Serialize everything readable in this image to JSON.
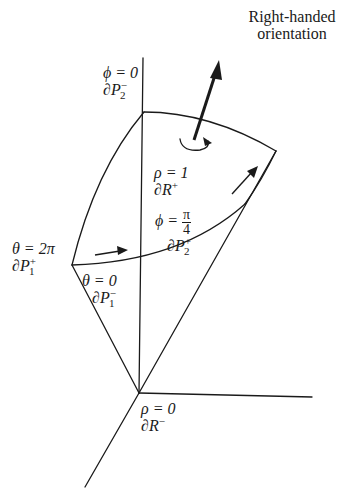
{
  "title": {
    "line1": "Right-handed",
    "line2": "orientation"
  },
  "labels": {
    "phi0": {
      "eq": "ϕ = 0",
      "face": "∂P",
      "face_sup": "−",
      "face_sub": "2"
    },
    "rho1": {
      "eq": "ρ = 1",
      "face": "∂R",
      "face_sup": "+"
    },
    "theta2pi": {
      "eq": "θ = 2π",
      "face": "∂P",
      "face_sup": "+",
      "face_sub": "1"
    },
    "theta0": {
      "eq": "θ = 0",
      "face": "∂P",
      "face_sup": "−",
      "face_sub": "1"
    },
    "phiPi4": {
      "eq_lhs": "ϕ =",
      "num": "π",
      "den": "4",
      "face": "∂P",
      "face_sup": "+",
      "face_sub": "2"
    },
    "rho0": {
      "eq": "ρ = 0",
      "face": "∂R",
      "face_sup": "−"
    }
  },
  "colors": {
    "ink": "#1a1a1a",
    "background": "#ffffff"
  }
}
